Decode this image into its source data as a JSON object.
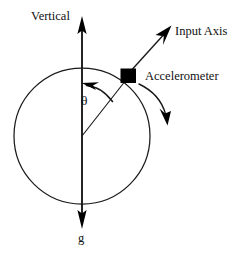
{
  "figure": {
    "kind": "technical-diagram",
    "width": 236,
    "height": 256,
    "background_color": "#ffffff",
    "ink_color": "#1a1a1a",
    "fill_color": "#000000"
  },
  "labels": {
    "vertical": "Vertical",
    "input_axis": "Input Axis",
    "accelerometer": "Accelerometer",
    "theta": "θ",
    "gravity": "g"
  },
  "geometry": {
    "circle": {
      "cx": 82,
      "cy": 136,
      "r": 68
    },
    "vertical_axis": {
      "x": 82,
      "y_top": 18,
      "y_bottom": 227
    },
    "accelerometer_box": {
      "x": 121,
      "y": 69,
      "w": 15,
      "h": 14
    },
    "input_axis_arrow": {
      "x1": 130,
      "y1": 73,
      "x2": 171,
      "y2": 27
    },
    "radius_line": {
      "x1": 82,
      "y1": 136,
      "x2": 126,
      "y2": 79
    },
    "angle_arc": {
      "start_x": 83,
      "start_y": 84,
      "end_x": 113,
      "end_y": 102
    },
    "rotation_arrow": {
      "start_x": 139,
      "start_y": 84,
      "end_x": 167,
      "end_y": 122
    }
  },
  "icons": {
    "up_arrowhead": "arrow-up",
    "down_arrowhead": "arrow-down",
    "input_arrowhead": "arrow-up-right",
    "rotation_arrowhead": "arrow-down-curved",
    "angle_arrowhead": "arrow-counterclockwise"
  }
}
